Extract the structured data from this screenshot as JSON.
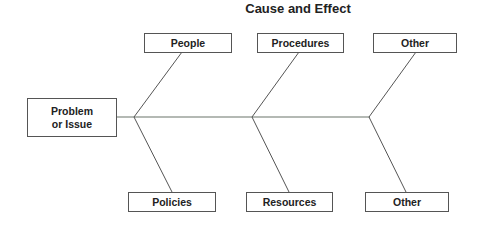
{
  "title": "Cause and Effect",
  "effect": {
    "label_line1": "Problem",
    "label_line2": "or Issue"
  },
  "causes_top": [
    {
      "label": "People"
    },
    {
      "label": "Procedures"
    },
    {
      "label": "Other"
    }
  ],
  "causes_bottom": [
    {
      "label": "Policies"
    },
    {
      "label": "Resources"
    },
    {
      "label": "Other"
    }
  ],
  "colors": {
    "line": "#555555",
    "spine": "#6a756a",
    "text": "#222222"
  }
}
